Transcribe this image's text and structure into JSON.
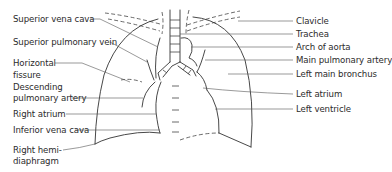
{
  "figure": {
    "type": "chest radiograph anatomy line diagram",
    "left_labels": [
      {
        "id": "superior-vena-cava",
        "text": "Superior vena cava"
      },
      {
        "id": "superior-pulmonary-vein",
        "text": "Superior pulmonary vein"
      },
      {
        "id": "horizontal-fissure-1",
        "text": "Horizontal"
      },
      {
        "id": "horizontal-fissure-2",
        "text": "fissure"
      },
      {
        "id": "descending-pulmonary-artery-1",
        "text": "Descending"
      },
      {
        "id": "descending-pulmonary-artery-2",
        "text": "pulmonary artery"
      },
      {
        "id": "right-atrium",
        "text": "Right atrium"
      },
      {
        "id": "inferior-vena-cava",
        "text": "Inferior vena cava"
      },
      {
        "id": "right-hemidiaphragm-1",
        "text": "Right hemi-"
      },
      {
        "id": "right-hemidiaphragm-2",
        "text": "diaphragm"
      }
    ],
    "right_labels": [
      {
        "id": "clavicle",
        "text": "Clavicle"
      },
      {
        "id": "trachea",
        "text": "Trachea"
      },
      {
        "id": "arch-of-aorta",
        "text": "Arch of aorta"
      },
      {
        "id": "main-pulmonary-artery",
        "text": "Main pulmonary artery"
      },
      {
        "id": "left-main-bronchus",
        "text": "Left main bronchus"
      },
      {
        "id": "left-atrium",
        "text": "Left atrium"
      },
      {
        "id": "left-ventricle",
        "text": "Left ventricle"
      }
    ]
  }
}
